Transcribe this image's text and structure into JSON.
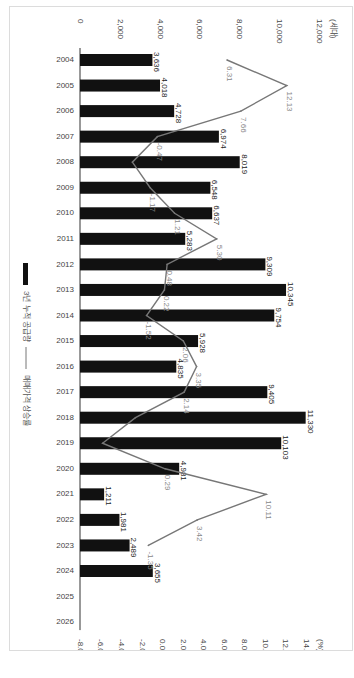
{
  "chart_data": {
    "type": "bar",
    "orientation": "rotated-90-clockwise",
    "categories": [
      "2004",
      "2005",
      "2006",
      "2007",
      "2008",
      "2009",
      "2010",
      "2011",
      "2012",
      "2013",
      "2014",
      "2015",
      "2016",
      "2017",
      "2018",
      "2019",
      "2020",
      "2021",
      "2022",
      "2023",
      "2024",
      "2025",
      "2026"
    ],
    "series": [
      {
        "name": "3년 누적 공급량",
        "type": "bar",
        "axis": "left",
        "values": [
          3636,
          4018,
          4728,
          6974,
          8019,
          6548,
          6637,
          5283,
          9309,
          10345,
          9754,
          5928,
          4835,
          9405,
          11330,
          10103,
          4981,
          1211,
          1981,
          2489,
          3655,
          null,
          null
        ],
        "labels": [
          "3,636",
          "4,018",
          "4,728",
          "6,974",
          "8,019",
          "6,548",
          "6,637",
          "5,283",
          "9,309",
          "10,345",
          "9,754",
          "5,928",
          "4,835",
          "9,405",
          "11,330",
          "10,103",
          "4,981",
          "1,211",
          "1,981",
          "2,489",
          "3,655",
          "",
          ""
        ],
        "color": "#111111"
      },
      {
        "name": "매매가격 상승률",
        "type": "line",
        "axis": "right",
        "values": [
          6.31,
          12.13,
          7.66,
          -0.47,
          -2.9,
          -1.17,
          1.21,
          5.3,
          0.48,
          0.22,
          -1.52,
          2.06,
          3.35,
          2.14,
          -2.6,
          -5.8,
          0.29,
          10.11,
          3.42,
          -1.35,
          null,
          null,
          null
        ],
        "labels": [
          "6.31",
          "12.13",
          "7.66",
          "-0.47",
          "",
          "-1.17",
          "1.21",
          "5.30",
          "0.48",
          "0.22",
          "-1.52",
          "2.06",
          "3.35",
          "2.14",
          "",
          "",
          "0.29",
          "10.11",
          "3.42",
          "-1.35",
          "",
          "",
          ""
        ],
        "color": "#777777"
      }
    ],
    "left_axis": {
      "unit": "(세대)",
      "ylim": [
        0,
        12000
      ],
      "ticks": [
        "0",
        "2,000",
        "4,000",
        "6,000",
        "8,000",
        "10,000",
        "12,000"
      ]
    },
    "right_axis": {
      "unit": "(%)",
      "ylim": [
        -8,
        14
      ],
      "ticks": [
        "-8.00",
        "-6.00",
        "-4.00",
        "-2.00",
        "0.00",
        "2.00",
        "4.00",
        "6.00",
        "8.00",
        "10.00",
        "12.00",
        "14.00"
      ]
    },
    "legend": {
      "placement": "left",
      "items": [
        "3년 누적 공급량",
        "매매가격 상승률"
      ]
    },
    "grid": false,
    "title": ""
  }
}
